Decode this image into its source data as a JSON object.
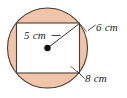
{
  "figure": {
    "shapes": {
      "circle": {
        "name": "circumscribed-circle",
        "cx": 47.5,
        "cy": 48,
        "r": 40,
        "fill_color": "#f0c4a8",
        "stroke_color": "#4a3b35"
      },
      "rectangle": {
        "name": "inscribed-rectangle",
        "x": 16.5,
        "y": 23,
        "width": 63,
        "height": 50,
        "fill_color": "#ffffff",
        "stroke_color": "#4a3b35"
      },
      "center_dot": {
        "name": "circle-center-dot",
        "cx": 47.5,
        "cy": 48,
        "r": 3.2,
        "color": "#111111"
      },
      "radius_line": {
        "name": "radius-segment",
        "x1": 47.5,
        "y1": 48,
        "x2": 79.5,
        "y2": 23.5,
        "color": "#333333"
      }
    },
    "labels": {
      "radius": "5 cm",
      "height": "6 cm",
      "width": "8 cm"
    },
    "leaders": {
      "radius": {
        "name": "radius-leader-line",
        "x1": 51.5,
        "y1": 35.5,
        "x2": 59.5,
        "y2": 35.5
      },
      "height": {
        "name": "height-leader-line",
        "x1": 88.0,
        "y1": 30.5,
        "x2": 95.0,
        "y2": 25.5
      },
      "width": {
        "name": "width-leader-line",
        "x1": 77.0,
        "y1": 71.5,
        "x2": 84.0,
        "y2": 78.5
      }
    }
  }
}
